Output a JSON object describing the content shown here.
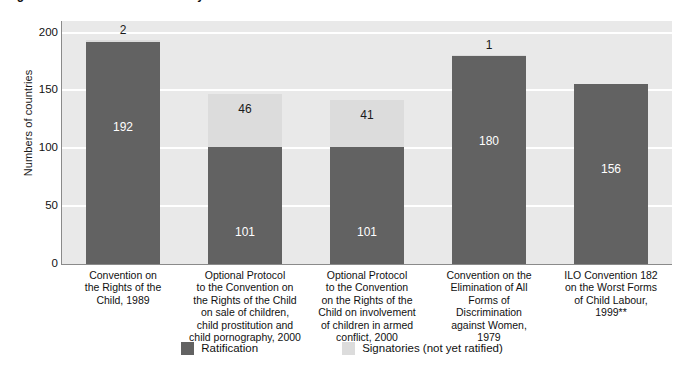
{
  "figure": {
    "title_clipped": "Figure: Status of ratification of key international instruments",
    "title_note": "*"
  },
  "chart_data": {
    "type": "bar",
    "stacked": true,
    "title": "",
    "xlabel": "",
    "ylabel": "Numbers of countries",
    "ylim": [
      0,
      210
    ],
    "yticks": [
      0,
      50,
      100,
      150,
      200
    ],
    "ytick_labels": [
      "0",
      "50",
      "100",
      "150",
      "200"
    ],
    "grid": true,
    "legend_position": "bottom",
    "categories": [
      "Convention on\nthe Rights of the\nChild, 1989",
      "Optional Protocol\nto the Convention on\nthe Rights of the Child\non sale of children,\nchild prostitution and\nchild pornography, 2000",
      "Optional Protocol\nto the Convention\non the Rights of the\nChild on involvement\nof children in armed\nconflict, 2000",
      "Convention on the\nElimination of All\nForms of\nDiscrimination\nagainst Women,\n1979",
      "ILO Convention 182\non the Worst Forms\nof Child Labour,\n1999**"
    ],
    "series": [
      {
        "name": "Ratification",
        "color": "#626262",
        "values": [
          192,
          101,
          101,
          180,
          156
        ]
      },
      {
        "name": "Signatories (not yet ratified)",
        "color": "#dcdcdc",
        "values": [
          2,
          46,
          41,
          1,
          0
        ]
      }
    ]
  },
  "axis": {
    "y_title": "Numbers of countries",
    "y_ticks": [
      "200",
      "150",
      "100",
      "50",
      "0"
    ]
  },
  "bars": [
    {
      "category_lines": [
        "Convention on",
        "the Rights of the",
        "Child, 1989"
      ],
      "ratified": "192",
      "signatory": "2",
      "ratified_value": 192,
      "signatory_value": 2,
      "signatory_outside": true
    },
    {
      "category_lines": [
        "Optional Protocol",
        "to the Convention on",
        "the Rights of the Child",
        "on sale of children,",
        "child prostitution and",
        "child pornography, 2000"
      ],
      "ratified": "101",
      "signatory": "46",
      "ratified_value": 101,
      "signatory_value": 46,
      "signatory_outside": false
    },
    {
      "category_lines": [
        "Optional Protocol",
        "to the Convention",
        "on the Rights of the",
        "Child on involvement",
        "of children in armed",
        "conflict, 2000"
      ],
      "ratified": "101",
      "signatory": "41",
      "ratified_value": 101,
      "signatory_value": 41,
      "signatory_outside": false
    },
    {
      "category_lines": [
        "Convention on the",
        "Elimination of All",
        "Forms of",
        "Discrimination",
        "against Women,",
        "1979"
      ],
      "ratified": "180",
      "signatory": "1",
      "ratified_value": 180,
      "signatory_value": 1,
      "signatory_outside": true
    },
    {
      "category_lines": [
        "ILO Convention 182",
        "on the Worst Forms",
        "of Child Labour,",
        "1999**"
      ],
      "ratified": "156",
      "signatory": "",
      "ratified_value": 156,
      "signatory_value": 0,
      "signatory_outside": false
    }
  ],
  "legend": {
    "items": [
      {
        "label": "Ratification",
        "color": "#626262"
      },
      {
        "label": "Signatories (not yet ratified)",
        "color": "#dcdcdc"
      }
    ]
  },
  "colors": {
    "plot_background": "#e9e9e9",
    "gridline": "#ffffff",
    "ratified": "#626262",
    "signatory": "#dcdcdc",
    "text": "#111111"
  }
}
